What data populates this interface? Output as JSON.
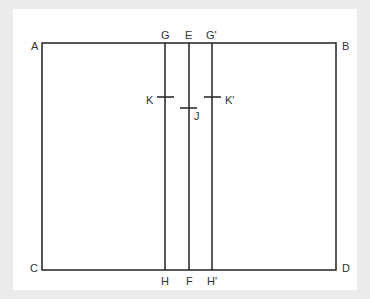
{
  "diagram": {
    "type": "line-diagram",
    "colors": {
      "background": "#ebebeb",
      "panel": "#ffffff",
      "stroke": "#222222",
      "label": "#333333"
    },
    "rectangle": {
      "corners": [
        "A",
        "B",
        "C",
        "D"
      ]
    },
    "labels": {
      "A": "A",
      "B": "B",
      "C": "C",
      "D": "D",
      "G": "G",
      "E": "E",
      "G_prime": "G'",
      "H": "H",
      "F": "F",
      "H_prime": "H'",
      "K": "K",
      "J": "J",
      "K_prime": "K'"
    },
    "vertical_lines": [
      {
        "top": "G",
        "bottom": "H",
        "tick": "K"
      },
      {
        "top": "E",
        "bottom": "F",
        "tick": "J"
      },
      {
        "top": "G'",
        "bottom": "H'",
        "tick": "K'"
      }
    ]
  }
}
